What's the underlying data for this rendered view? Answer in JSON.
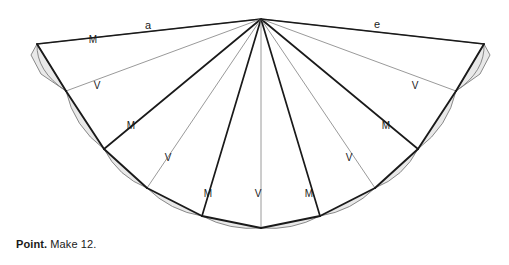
{
  "figure": {
    "name": "fan-crease-pattern",
    "apex": [
      261,
      19
    ],
    "colors": {
      "mountain_line": "#1a1a1a",
      "valley_line": "#9a9a9a",
      "outline": "#7d7d7d",
      "shading": "#e9e9e9",
      "text": "#1a1a1a",
      "background": "#ffffff"
    },
    "labels": [
      {
        "id": "label-a",
        "text": "a",
        "x": 148,
        "y": 29,
        "size": 11
      },
      {
        "id": "label-e",
        "text": "e",
        "x": 377,
        "y": 28,
        "size": 11
      },
      {
        "id": "label-m-top-left",
        "text": "M",
        "x": 93,
        "y": 43,
        "size": 10
      },
      {
        "id": "label-v-left-outer",
        "text": "V",
        "x": 97,
        "y": 89,
        "size": 10
      },
      {
        "id": "label-v-right-outer",
        "text": "V",
        "x": 415,
        "y": 89,
        "size": 10
      },
      {
        "id": "label-m-left-mid",
        "text": "M",
        "x": 131,
        "y": 129,
        "size": 10
      },
      {
        "id": "label-m-right-mid",
        "text": "M",
        "x": 386,
        "y": 129,
        "size": 10
      },
      {
        "id": "label-v-left-inner",
        "text": "V",
        "x": 168,
        "y": 161,
        "size": 10
      },
      {
        "id": "label-v-right-inner",
        "text": "V",
        "x": 349,
        "y": 161,
        "size": 10
      },
      {
        "id": "label-m-bottom-left",
        "text": "M",
        "x": 208,
        "y": 197,
        "size": 10
      },
      {
        "id": "label-v-bottom-center",
        "text": "V",
        "x": 258,
        "y": 197,
        "size": 10
      },
      {
        "id": "label-m-bottom-right",
        "text": "M",
        "x": 309,
        "y": 197,
        "size": 10
      }
    ],
    "rim_points": [
      [
        37,
        44
      ],
      [
        66,
        91
      ],
      [
        104,
        149
      ],
      [
        147,
        188
      ],
      [
        202,
        216
      ],
      [
        261,
        228
      ],
      [
        320,
        216
      ],
      [
        375,
        188
      ],
      [
        418,
        149
      ],
      [
        456,
        91
      ],
      [
        484,
        44
      ]
    ],
    "arc_bulges": [
      16,
      13,
      11,
      10,
      9,
      9,
      10,
      11,
      13,
      16
    ],
    "spoke_styles": [
      "mountain",
      "valley",
      "mountain",
      "valley",
      "mountain",
      "valley",
      "mountain",
      "valley",
      "mountain",
      "valley",
      "mountain"
    ]
  },
  "caption": {
    "lead": "Point.",
    "rest": " Make 12."
  }
}
